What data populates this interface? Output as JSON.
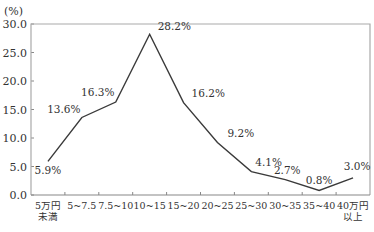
{
  "chart_data": {
    "type": "line",
    "title": "",
    "unit_label": "(%)",
    "xlabel": "",
    "ylabel": "(%)",
    "ylim": [
      0,
      30
    ],
    "yticks": [
      "0.0",
      "5.0",
      "10.0",
      "15.0",
      "20.0",
      "25.0",
      "30.0"
    ],
    "grid": false,
    "legend": null,
    "categories": [
      [
        "5万円",
        "未満"
      ],
      [
        "5~7.5"
      ],
      [
        "7.5~10"
      ],
      [
        "10~15"
      ],
      [
        "15~20"
      ],
      [
        "20~25"
      ],
      [
        "25~30"
      ],
      [
        "30~35"
      ],
      [
        "35~40"
      ],
      [
        "40万円",
        "以上"
      ]
    ],
    "values": [
      5.9,
      13.6,
      16.3,
      28.2,
      16.2,
      9.2,
      4.1,
      2.7,
      0.8,
      3.0
    ],
    "data_labels": [
      "5.9%",
      "13.6%",
      "16.3%",
      "28.2%",
      "16.2%",
      "9.2%",
      "4.1%",
      "2.7%",
      "0.8%",
      "3.0%"
    ],
    "colors": {
      "line": "#3a3a3a",
      "axis": "#888888",
      "frame": "#aaaaaa"
    }
  }
}
